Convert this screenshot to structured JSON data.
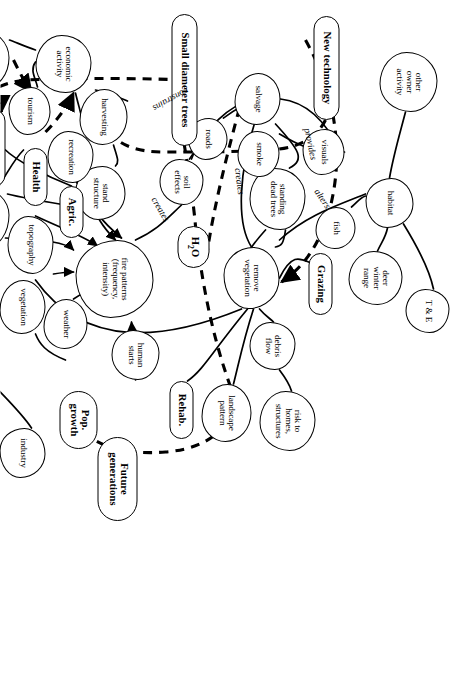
{
  "diagram": {
    "orientation_degrees": 90,
    "stroke_color": "#000000",
    "background_color": "#ffffff",
    "nodes": [
      {
        "id": "other_owner_activity",
        "label": "other\nowner\nactivity",
        "style": "blob",
        "x": 52,
        "y": 28,
        "w": 60,
        "h": 58
      },
      {
        "id": "habitat",
        "label": "habitat",
        "style": "blob",
        "x": 178,
        "y": 52,
        "w": 50,
        "h": 48
      },
      {
        "id": "te",
        "label": "T & E",
        "style": "blob",
        "x": 289,
        "y": 16,
        "w": 44,
        "h": 44
      },
      {
        "id": "deer_winter_range",
        "label": "deer\nwinter\nrange",
        "style": "blob",
        "x": 251,
        "y": 63,
        "w": 54,
        "h": 54
      },
      {
        "id": "fish",
        "label": "fish",
        "style": "blob",
        "x": 207,
        "y": 110,
        "w": 42,
        "h": 40
      },
      {
        "id": "visuals",
        "label": "visuals",
        "style": "blob",
        "x": 129,
        "y": 121,
        "w": 46,
        "h": 42
      },
      {
        "id": "new_technology",
        "label": "New technology",
        "style": "driver",
        "x": 16,
        "y": 126,
        "w": 104,
        "h": 26
      },
      {
        "id": "grazing",
        "label": "Grazing",
        "style": "driver",
        "x": 253,
        "y": 133,
        "w": 62,
        "h": 24
      },
      {
        "id": "standing_dead_trees",
        "label": "standing\ndead trees",
        "style": "blob",
        "x": 168,
        "y": 160,
        "w": 62,
        "h": 56
      },
      {
        "id": "smoke",
        "label": "smoke",
        "style": "blob",
        "x": 131,
        "y": 186,
        "w": 46,
        "h": 42
      },
      {
        "id": "salvage",
        "label": "salvage",
        "style": "blob",
        "x": 73,
        "y": 185,
        "w": 52,
        "h": 46
      },
      {
        "id": "remove_vegetation",
        "label": "remove\nvegetation",
        "style": "blob",
        "x": 247,
        "y": 186,
        "w": 62,
        "h": 56
      },
      {
        "id": "debris_flow",
        "label": "debris\nflow",
        "style": "blob",
        "x": 322,
        "y": 170,
        "w": 48,
        "h": 46
      },
      {
        "id": "risk_homes",
        "label": "risk to\nhomes,\nstructures",
        "style": "blob",
        "x": 391,
        "y": 150,
        "w": 60,
        "h": 56
      },
      {
        "id": "landscape_pattern",
        "label": "landscape\npattern",
        "style": "blob",
        "x": 384,
        "y": 214,
        "w": 58,
        "h": 50
      },
      {
        "id": "roads",
        "label": "roads",
        "style": "blob",
        "x": 118,
        "y": 238,
        "w": 42,
        "h": 40
      },
      {
        "id": "soil_effects",
        "label": "soil\neffects",
        "style": "blob",
        "x": 159,
        "y": 262,
        "w": 46,
        "h": 44
      },
      {
        "id": "h2o",
        "label": "H2O",
        "style": "driver",
        "x": 226,
        "y": 256,
        "w": 42,
        "h": 32
      },
      {
        "id": "rehab",
        "label": "Rehab.",
        "style": "driver",
        "x": 381,
        "y": 272,
        "w": 58,
        "h": 24
      },
      {
        "id": "small_diameter_trees",
        "label": "Small diameter trees",
        "style": "driver",
        "x": 14,
        "y": 268,
        "w": 132,
        "h": 26
      },
      {
        "id": "fire_patterns",
        "label": "fire patterns\n(frequency,\nintensity)",
        "style": "blob",
        "x": 240,
        "y": 312,
        "w": 78,
        "h": 78
      },
      {
        "id": "human_starts",
        "label": "human\nstarts",
        "style": "blob",
        "x": 330,
        "y": 306,
        "w": 50,
        "h": 48
      },
      {
        "id": "future_generations",
        "label": "Future\ngenerations",
        "style": "driver",
        "x": 437,
        "y": 328,
        "w": 84,
        "h": 40
      },
      {
        "id": "harvesting",
        "label": "harvesting",
        "style": "blob",
        "x": 89,
        "y": 338,
        "w": 56,
        "h": 48
      },
      {
        "id": "stand_structure",
        "label": "stand\nstructure",
        "style": "blob",
        "x": 166,
        "y": 340,
        "w": 54,
        "h": 50
      },
      {
        "id": "economic_activity",
        "label": "economic\nactivity",
        "style": "blob",
        "x": 35,
        "y": 374,
        "w": 58,
        "h": 56
      },
      {
        "id": "recreation",
        "label": "recreation",
        "style": "blob",
        "x": 131,
        "y": 372,
        "w": 52,
        "h": 46
      },
      {
        "id": "agric",
        "label": "Agric.",
        "style": "driver",
        "x": 186,
        "y": 382,
        "w": 52,
        "h": 24
      },
      {
        "id": "weather",
        "label": "weather",
        "style": "blob",
        "x": 299,
        "y": 378,
        "w": 50,
        "h": 44
      },
      {
        "id": "pop_growth",
        "label": "Pop.\ngrowth",
        "style": "driver",
        "x": 391,
        "y": 368,
        "w": 58,
        "h": 38
      },
      {
        "id": "tourism",
        "label": "tourism",
        "style": "blob",
        "x": 87,
        "y": 415,
        "w": 48,
        "h": 42
      },
      {
        "id": "health",
        "label": "Health",
        "style": "driver",
        "x": 148,
        "y": 418,
        "w": 58,
        "h": 24
      },
      {
        "id": "topography",
        "label": "topography",
        "style": "blob",
        "x": 216,
        "y": 412,
        "w": 58,
        "h": 46
      },
      {
        "id": "vegetation",
        "label": "vegetation",
        "style": "blob",
        "x": 280,
        "y": 420,
        "w": 54,
        "h": 46
      },
      {
        "id": "industry",
        "label": "industry",
        "style": "blob",
        "x": 428,
        "y": 420,
        "w": 50,
        "h": 46
      },
      {
        "id": "community_effects",
        "label": "community\neffects",
        "style": "blob",
        "x": 30,
        "y": 456,
        "w": 58,
        "h": 52
      },
      {
        "id": "education",
        "label": "Education",
        "style": "driver",
        "x": 109,
        "y": 460,
        "w": 78,
        "h": 24
      },
      {
        "id": "suppression_efforts",
        "label": "suppression\nefforts",
        "style": "blob",
        "x": 188,
        "y": 456,
        "w": 60,
        "h": 52
      },
      {
        "id": "trust_usfs",
        "label": "trust in\nUSFS",
        "style": "blob",
        "x": 123,
        "y": 506,
        "w": 46,
        "h": 44
      },
      {
        "id": "quality_of_life",
        "label": "Quality\nof life",
        "style": "driver",
        "x": 196,
        "y": 510,
        "w": 62,
        "h": 38
      },
      {
        "id": "past_management_actions",
        "label": "past\nmanagement\nactions",
        "style": "blob",
        "x": 278,
        "y": 496,
        "w": 68,
        "h": 62
      },
      {
        "id": "state_agendas",
        "label": "state\nagendas",
        "style": "blob",
        "x": 381,
        "y": 506,
        "w": 52,
        "h": 48
      },
      {
        "id": "federal_agencies",
        "label": "federal\nagencies",
        "style": "blob",
        "x": 305,
        "y": 542,
        "w": 56,
        "h": 52
      }
    ],
    "edge_labels": [
      {
        "id": "alters",
        "text": "alters"
      },
      {
        "id": "provides",
        "text": "provides"
      },
      {
        "id": "creates_upper",
        "text": "creates"
      },
      {
        "id": "constrains",
        "text": "constrains"
      },
      {
        "id": "creates_lower",
        "text": "creates"
      }
    ],
    "legend_note": ""
  }
}
